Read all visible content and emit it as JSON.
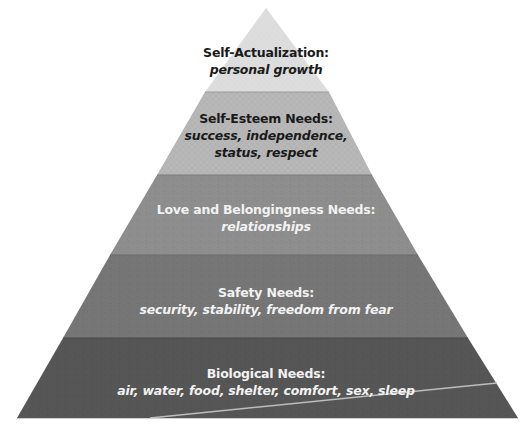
{
  "diagram": {
    "type": "pyramid",
    "apex": [
      266,
      8
    ],
    "base": {
      "y": 418,
      "left": 17,
      "right": 518
    },
    "tiers": [
      {
        "title": "Self-Actualization:",
        "desc_lines": [
          "personal growth"
        ],
        "fill": "#dcdcdc",
        "text_color": "#1a1a1a",
        "y_top": 8,
        "y_bottom": 92
      },
      {
        "title": "Self-Esteem Needs:",
        "desc_lines": [
          "success, independence,",
          "status, respect"
        ],
        "fill": "#b4b4b4",
        "text_color": "#1a1a1a",
        "y_top": 92,
        "y_bottom": 175
      },
      {
        "title": "Love and Belongingness Needs:",
        "desc_lines": [
          "relationships"
        ],
        "fill": "#8e8e8e",
        "text_color": "#f2f2f2",
        "y_top": 175,
        "y_bottom": 255
      },
      {
        "title": "Safety Needs:",
        "desc_lines": [
          "security, stability, freedom from fear"
        ],
        "fill": "#767676",
        "text_color": "#f2f2f2",
        "y_top": 255,
        "y_bottom": 338
      },
      {
        "title": "Biological Needs:",
        "desc_lines": [
          "air, water, food, shelter, comfort, sex, sleep"
        ],
        "fill": "#565656",
        "text_color": "#f2f2f2",
        "y_top": 338,
        "y_bottom": 418
      }
    ],
    "accent_line": {
      "from": [
        150,
        418
      ],
      "to": [
        497,
        383
      ],
      "color": "#bdbdbd"
    }
  }
}
